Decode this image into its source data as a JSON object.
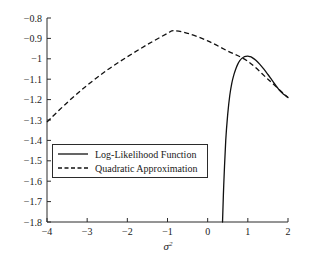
{
  "chart_data": {
    "type": "line",
    "title": "",
    "xlabel": "σ²",
    "ylabel": "",
    "xlim": [
      -4,
      2
    ],
    "ylim": [
      -1.8,
      -0.8
    ],
    "grid": false,
    "legend_position": "center-left",
    "xticks": [
      -4,
      -3,
      -2,
      -1,
      0,
      1,
      2
    ],
    "xtick_labels": [
      "−4",
      "−3",
      "−2",
      "−1",
      "0",
      "1",
      "2"
    ],
    "yticks": [
      -0.8,
      -0.9,
      -1.0,
      -1.1,
      -1.2,
      -1.3,
      -1.4,
      -1.5,
      -1.6,
      -1.7,
      -1.8
    ],
    "ytick_labels": [
      "−0.8",
      "−0.9",
      "−1",
      "−1.1",
      "−1.2",
      "−1.3",
      "−1.4",
      "−1.5",
      "−1.6",
      "−1.7",
      "−1.8"
    ],
    "series": [
      {
        "name": "Log-Likelihood Function",
        "style": "solid",
        "color": "#111111",
        "x": [
          0.37,
          0.4,
          0.45,
          0.5,
          0.55,
          0.6,
          0.65,
          0.7,
          0.75,
          0.8,
          0.85,
          0.9,
          0.95,
          1.0,
          1.05,
          1.1,
          1.2,
          1.3,
          1.4,
          1.5,
          1.6,
          1.7,
          1.8,
          1.9,
          2.0
        ],
        "y": [
          -1.8,
          -1.62,
          -1.4,
          -1.27,
          -1.18,
          -1.12,
          -1.08,
          -1.05,
          -1.026,
          -1.009,
          -0.998,
          -0.991,
          -0.988,
          -0.987,
          -0.989,
          -0.993,
          -1.007,
          -1.027,
          -1.051,
          -1.077,
          -1.104,
          -1.131,
          -1.157,
          -1.175,
          -1.19
        ]
      },
      {
        "name": "Quadratic Approximation",
        "style": "dashed",
        "color": "#111111",
        "x": [
          -4.0,
          -3.5,
          -3.0,
          -2.5,
          -2.0,
          -1.5,
          -1.0,
          -0.85,
          -0.5,
          0.0,
          0.5,
          1.0,
          1.5,
          2.0
        ],
        "y": [
          -1.31,
          -1.215,
          -1.13,
          -1.055,
          -0.99,
          -0.93,
          -0.875,
          -0.862,
          -0.875,
          -0.912,
          -0.962,
          -1.012,
          -1.1,
          -1.19
        ]
      }
    ]
  },
  "legend": {
    "entries": [
      {
        "label": "Log-Likelihood Function",
        "style": "solid"
      },
      {
        "label": "Quadratic Approximation",
        "style": "dashed"
      }
    ]
  }
}
